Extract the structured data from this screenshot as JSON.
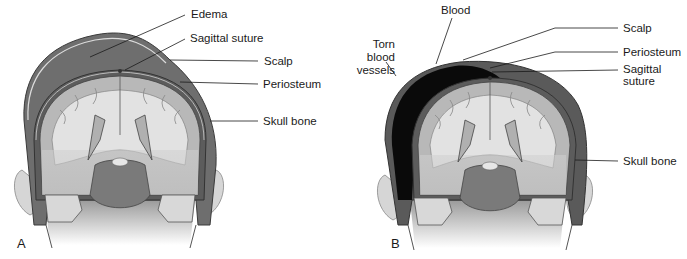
{
  "figure": {
    "panels": [
      {
        "id": "A",
        "letter": "A",
        "labels": {
          "edema": "Edema",
          "sagittal_suture": "Sagittal suture",
          "scalp": "Scalp",
          "periosteum": "Periosteum",
          "skull_bone": "Skull bone"
        }
      },
      {
        "id": "B",
        "letter": "B",
        "labels": {
          "blood": "Blood",
          "torn_vessels_l1": "Torn",
          "torn_vessels_l2": "blood",
          "torn_vessels_l3": "vessels",
          "scalp": "Scalp",
          "periosteum": "Periosteum",
          "sagittal_l1": "Sagittal",
          "sagittal_l2": "suture",
          "skull_bone": "Skull bone"
        }
      }
    ],
    "colors": {
      "edema": "#6e6e6e",
      "blood": "#0a0a0a",
      "scalp_outer": "#5a5a5a",
      "brain_gray": "#b8b8b8",
      "brain_white": "#e2e2e2",
      "brainstem": "#7a7a7a",
      "ear": "#d6d6d6",
      "leader_line": "#1a1a1a"
    }
  }
}
